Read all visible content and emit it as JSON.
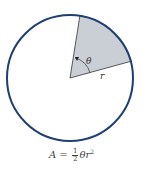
{
  "diagram": {
    "circle": {
      "cx": 70,
      "cy": 78,
      "r": 63,
      "stroke": "#1f3f73",
      "fill": "#ffffff"
    },
    "sector": {
      "fill": "#c9cfd5",
      "p1": [
        80,
        15
      ],
      "p2": [
        132,
        61
      ]
    },
    "labels": {
      "angle": "θ",
      "radius": "r"
    },
    "formula": {
      "lhs": "A",
      "equals": "=",
      "numerator": "1",
      "denominator": "2",
      "theta": "θ",
      "r": "r",
      "exponent": "2"
    }
  }
}
